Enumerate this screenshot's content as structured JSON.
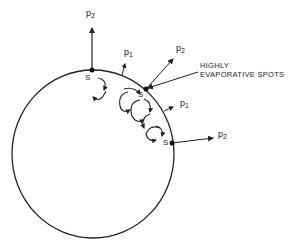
{
  "diagram": {
    "type": "droplet-surface-evaporation",
    "stroke_color": "#222222",
    "droplet": {
      "cx": 93,
      "cy": 154,
      "rx": 81,
      "ry": 84
    },
    "spots": [
      {
        "id": "top",
        "label": "S",
        "x": 92,
        "y": 70
      },
      {
        "id": "middle",
        "label": "S",
        "x": 146,
        "y": 89
      },
      {
        "id": "right",
        "label": "S",
        "x": 172,
        "y": 143
      }
    ],
    "pressure_labels": [
      {
        "id": "p2-top",
        "symbol": "p",
        "subscript": "2"
      },
      {
        "id": "p1-upper",
        "symbol": "p",
        "subscript": "1"
      },
      {
        "id": "p2-middle",
        "symbol": "p",
        "subscript": "2"
      },
      {
        "id": "p1-right",
        "symbol": "p",
        "subscript": "1"
      },
      {
        "id": "p2-right",
        "symbol": "p",
        "subscript": "2"
      }
    ],
    "annotation": {
      "line1": "HIGHLY",
      "line2": "EVAPORATIVE SPOTS"
    }
  }
}
